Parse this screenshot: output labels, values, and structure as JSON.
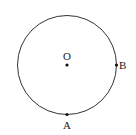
{
  "diagram": {
    "type": "circle-with-points",
    "center_label": "O",
    "points": [
      {
        "label": "B",
        "position": "right"
      },
      {
        "label": "A",
        "position": "bottom"
      }
    ],
    "stroke_color": "#333333",
    "point_color": "#111111"
  }
}
